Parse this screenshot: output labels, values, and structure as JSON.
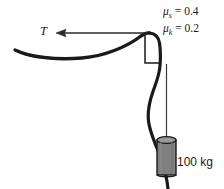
{
  "figure": {
    "background_color": "#ffffff",
    "width": 224,
    "height": 189
  },
  "labels": {
    "tension": "T",
    "mass": "100 kg",
    "mu_static": {
      "symbol": "μ",
      "subscript": "s",
      "equals": " = ",
      "value": "0.4"
    },
    "mu_kinetic": {
      "symbol": "μ",
      "subscript": "k",
      "equals": " = ",
      "value": "0.2"
    }
  },
  "colors": {
    "rope": "#1a1a1a",
    "arrow": "#2b2b2b",
    "corner_marker": "#1a1a1a",
    "weight_body": "#808080",
    "weight_outline": "#1a1a1a",
    "weight_top": "#9a9a9a",
    "hanger_line": "#3a3a3a",
    "text": "#1a1a1a"
  },
  "geometry": {
    "rope_left_end": [
      15,
      50
    ],
    "rope_corner": [
      148,
      33
    ],
    "rope_bottom_exit": [
      168,
      189
    ],
    "arrow_tip": [
      57,
      33
    ],
    "arrow_tail": [
      147,
      33
    ],
    "corner_marker_rect": [
      145,
      34,
      15,
      29
    ],
    "weight_rect": [
      157,
      138,
      19,
      37
    ]
  }
}
